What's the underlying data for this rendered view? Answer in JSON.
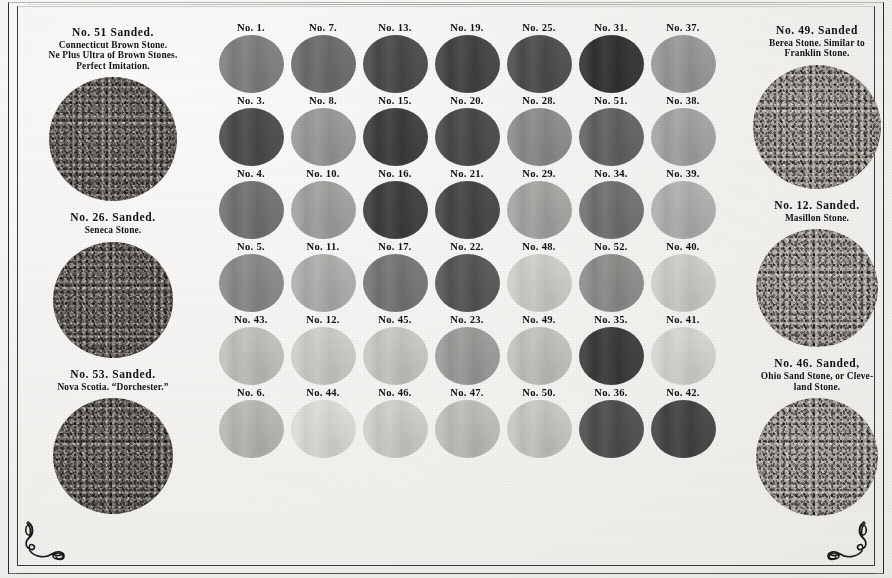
{
  "document": {
    "kind": "color-sample-card",
    "title_visible": false
  },
  "left_column": {
    "swatches": [
      {
        "id": "no-51",
        "label_main": "No. 51   Sanded.",
        "label_sub": "Connecticut Brown Stone.\nNe Plus Ultra of Brown Stones.\nPerfect Imitation.",
        "color": "#6f6c66",
        "diameter": 128
      },
      {
        "id": "no-26",
        "label_main": "No. 26.  Sanded.",
        "label_sub": "Seneca Stone.",
        "color": "#6a6760",
        "diameter": 120
      },
      {
        "id": "no-53",
        "label_main": "No. 53.  Sanded.",
        "label_sub": "Nova Scotia.  “Dorchester.”",
        "color": "#6b6862",
        "diameter": 120
      }
    ]
  },
  "right_column": {
    "swatches": [
      {
        "id": "no-49-sanded",
        "label_main": "No. 49.  Sanded",
        "label_sub": "Berea Stone.  Similar to\nFranklin Stone.",
        "color": "#9e9b94",
        "diameter": 128
      },
      {
        "id": "no-12-sanded",
        "label_main": "No. 12.  Sanded.",
        "label_sub": "Masillon Stone.",
        "color": "#a09d96",
        "diameter": 122
      },
      {
        "id": "no-46-sanded",
        "label_main": "No. 46.  Sanded,",
        "label_sub": "Ohio Sand Stone, or Cleve-\nland Stone.",
        "color": "#a29f98",
        "diameter": 122
      }
    ]
  },
  "grid": {
    "columns": 7,
    "rows": [
      {
        "cells": [
          {
            "label": "No. 1.",
            "color": "#575köpa"
          },
          {
            "label": "No. 7.",
            "color": "#6e6d6b"
          },
          {
            "label": "No. 13.",
            "color": "#4b4a49"
          },
          {
            "label": "No. 19.",
            "color": "#444342"
          },
          {
            "label": "No. 25.",
            "color": "#4e4d4c"
          },
          {
            "label": "No. 31.",
            "color": "#333231"
          },
          {
            "label": "No. 37.",
            "color": "#9a9997"
          }
        ]
      },
      {
        "cells": [
          {
            "label": "No. 3.",
            "color": "#4c4b4a"
          },
          {
            "label": "No. 8.",
            "color": "#9b9a98"
          },
          {
            "label": "No. 15.",
            "color": "#3e3d3c"
          },
          {
            "label": "No. 20.",
            "color": "#4a4948"
          },
          {
            "label": "No. 28.",
            "color": "#8d8c8a"
          },
          {
            "label": "No. 51.",
            "color": "#636260"
          },
          {
            "label": "No. 38.",
            "color": "#a5a4a2"
          }
        ]
      },
      {
        "cells": [
          {
            "label": "No.  4.",
            "color": "#73726f"
          },
          {
            "label": "No. 10.",
            "color": "#a3a29f"
          },
          {
            "label": "No. 16.",
            "color": "#3f3e3d"
          },
          {
            "label": "No. 21.",
            "color": "#474645"
          },
          {
            "label": "No. 29.",
            "color": "#a6a5a2"
          },
          {
            "label": "No. 34.",
            "color": "#727170"
          },
          {
            "label": "No. 39.",
            "color": "#b1b0ad"
          }
        ]
      },
      {
        "cells": [
          {
            "label": "No. 5.",
            "color": "#8b8a88"
          },
          {
            "label": "No. 11.",
            "color": "#b0afac"
          },
          {
            "label": "No. 17.",
            "color": "#777674"
          },
          {
            "label": "No. 22.",
            "color": "#57565 5"
          },
          {
            "label": "No. 48.",
            "color": "#cfcec9"
          },
          {
            "label": "No. 52.",
            "color": "#8e8d8a"
          },
          {
            "label": "No. 40.",
            "color": "#cecdc8"
          }
        ]
      },
      {
        "cells": [
          {
            "label": "No. 43.",
            "color": "#c2c1bc"
          },
          {
            "label": "No. 12.",
            "color": "#cecdc7"
          },
          {
            "label": "No. 45.",
            "color": "#c9c8c2"
          },
          {
            "label": "No. 23.",
            "color": "#9d9c99"
          },
          {
            "label": "No. 49.",
            "color": "#c3c2bd"
          },
          {
            "label": "No. 35.",
            "color": "#3c3b3a"
          },
          {
            "label": "No. 41.",
            "color": "#d6d5d0"
          }
        ]
      },
      {
        "cells": [
          {
            "label": "No. 6.",
            "color": "#b9b8b3"
          },
          {
            "label": "No. 44.",
            "color": "#dedcd7"
          },
          {
            "label": "No. 46.",
            "color": "#cfcec9"
          },
          {
            "label": "No. 47.",
            "color": "#bfbeb9"
          },
          {
            "label": "No. 50.",
            "color": "#c8c7c2"
          },
          {
            "label": "No. 36.",
            "color": "#4f4e4d"
          },
          {
            "label": "No. 42.",
            "color": "#45444 3"
          }
        ]
      }
    ]
  },
  "ornaments": {
    "bottom_left": "corner-flourish",
    "bottom_right": "corner-flourish"
  },
  "palette": {
    "paper": "#f2f1ee",
    "ink": "#121212",
    "rule": "#2b2b2b"
  }
}
